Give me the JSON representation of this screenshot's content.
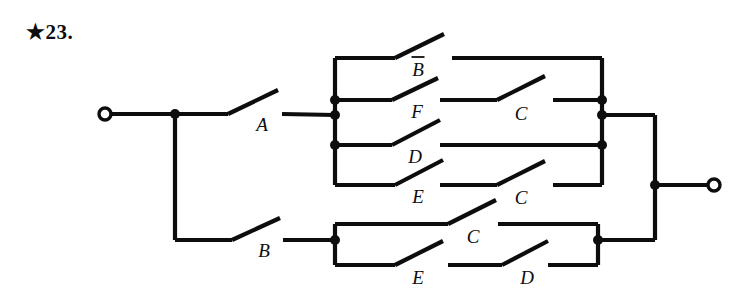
{
  "problem": {
    "marker": "★",
    "number": "23."
  },
  "figure": {
    "type": "switching-circuit-diagram",
    "width": 744,
    "height": 301,
    "stroke_color": "#0d0d0d",
    "background_color": "#ffffff",
    "terminals": [
      {
        "id": "input",
        "name": "left-terminal",
        "x": 105,
        "y": 114,
        "r": 6
      },
      {
        "id": "output",
        "name": "right-terminal",
        "x": 714,
        "y": 185,
        "r": 6
      }
    ],
    "junctions": [
      {
        "name": "input-split-node",
        "x": 175,
        "y": 114
      },
      {
        "name": "upper-left-bus-node-f",
        "x": 335,
        "y": 100
      },
      {
        "name": "upper-left-bus-node-a",
        "x": 335,
        "y": 115
      },
      {
        "name": "upper-left-bus-node-d",
        "x": 335,
        "y": 145
      },
      {
        "name": "upper-right-bus-node-f",
        "x": 602,
        "y": 100
      },
      {
        "name": "upper-right-bus-node-out",
        "x": 602,
        "y": 115
      },
      {
        "name": "upper-right-bus-node-d",
        "x": 602,
        "y": 145
      },
      {
        "name": "lower-left-bus-node-b",
        "x": 335,
        "y": 240
      },
      {
        "name": "lower-right-bus-node",
        "x": 598,
        "y": 240
      },
      {
        "name": "output-merge-node",
        "x": 655,
        "y": 185
      }
    ],
    "wires": [
      {
        "name": "input-lead",
        "points": "111,114 175,114"
      },
      {
        "name": "input-to-switch-a",
        "points": "175,114 228,114"
      },
      {
        "name": "input-down-to-b-branch",
        "points": "175,114 175,240"
      },
      {
        "name": "b-branch-to-switch-b",
        "points": "175,240 232,240"
      },
      {
        "name": "switch-a-out-to-upper-bus",
        "points": "282,114 335,115"
      },
      {
        "name": "switch-b-out-to-lower-bus",
        "points": "283,240 335,240"
      },
      {
        "name": "upper-left-bus",
        "points": "335,58 335,185"
      },
      {
        "name": "upper-rail-bbar-in",
        "points": "335,58 395,58"
      },
      {
        "name": "upper-rail-f-in",
        "points": "335,100 392,100"
      },
      {
        "name": "upper-rail-d-in",
        "points": "335,145 392,145"
      },
      {
        "name": "upper-rail-e-in",
        "points": "335,185 395,185"
      },
      {
        "name": "upper-rail-bbar-out",
        "points": "452,58 602,58"
      },
      {
        "name": "upper-rail-f-mid",
        "points": "440,100 497,100"
      },
      {
        "name": "upper-rail-f-out",
        "points": "553,100 602,100"
      },
      {
        "name": "upper-rail-d-out",
        "points": "440,145 602,145"
      },
      {
        "name": "upper-rail-e-mid",
        "points": "440,185 497,185"
      },
      {
        "name": "upper-rail-e-out",
        "points": "553,185 602,185"
      },
      {
        "name": "upper-right-bus",
        "points": "602,58 602,185"
      },
      {
        "name": "upper-block-to-output",
        "points": "602,115 655,115"
      },
      {
        "name": "lower-left-bus",
        "points": "335,224 335,265"
      },
      {
        "name": "lower-rail-c-in",
        "points": "335,224 448,224"
      },
      {
        "name": "lower-rail-e-in",
        "points": "335,265 395,265"
      },
      {
        "name": "lower-rail-c-out",
        "points": "498,224 598,224"
      },
      {
        "name": "lower-rail-d-mid",
        "points": "448,265 502,265"
      },
      {
        "name": "lower-rail-d-out",
        "points": "548,265 598,265"
      },
      {
        "name": "lower-right-bus",
        "points": "598,224 598,265"
      },
      {
        "name": "lower-block-to-output",
        "points": "598,240 655,240"
      },
      {
        "name": "output-vertical-bus",
        "points": "655,115 655,240"
      },
      {
        "name": "output-lead",
        "points": "655,185 708,185"
      }
    ],
    "switches": [
      {
        "name": "switch-a",
        "label": "A",
        "overbar": false,
        "pivot_x": 228,
        "pivot_y": 114,
        "tip_x": 278,
        "tip_y": 90,
        "label_x": 262,
        "label_y": 131
      },
      {
        "name": "switch-b",
        "label": "B",
        "overbar": false,
        "pivot_x": 232,
        "pivot_y": 240,
        "tip_x": 280,
        "tip_y": 218,
        "label_x": 264,
        "label_y": 257
      },
      {
        "name": "switch-b-bar",
        "label": "B",
        "overbar": true,
        "pivot_x": 395,
        "pivot_y": 58,
        "tip_x": 444,
        "tip_y": 34,
        "label_x": 418,
        "label_y": 76
      },
      {
        "name": "switch-f",
        "label": "F",
        "overbar": false,
        "pivot_x": 392,
        "pivot_y": 100,
        "tip_x": 438,
        "tip_y": 78,
        "label_x": 417,
        "label_y": 118
      },
      {
        "name": "switch-d-upper",
        "label": "D",
        "overbar": false,
        "pivot_x": 392,
        "pivot_y": 145,
        "tip_x": 440,
        "tip_y": 120,
        "label_x": 415,
        "label_y": 163
      },
      {
        "name": "switch-e-upper",
        "label": "E",
        "overbar": false,
        "pivot_x": 395,
        "pivot_y": 185,
        "tip_x": 443,
        "tip_y": 160,
        "label_x": 418,
        "label_y": 203
      },
      {
        "name": "switch-c-upper",
        "label": "C",
        "overbar": false,
        "pivot_x": 497,
        "pivot_y": 100,
        "tip_x": 545,
        "tip_y": 76,
        "label_x": 521,
        "label_y": 120
      },
      {
        "name": "switch-c-upper-2",
        "label": "C",
        "overbar": false,
        "pivot_x": 497,
        "pivot_y": 185,
        "tip_x": 545,
        "tip_y": 161,
        "label_x": 521,
        "label_y": 204
      },
      {
        "name": "switch-c-lower",
        "label": "C",
        "overbar": false,
        "pivot_x": 448,
        "pivot_y": 224,
        "tip_x": 496,
        "tip_y": 200,
        "label_x": 473,
        "label_y": 243
      },
      {
        "name": "switch-e-lower",
        "label": "E",
        "overbar": false,
        "pivot_x": 395,
        "pivot_y": 265,
        "tip_x": 443,
        "tip_y": 241,
        "label_x": 418,
        "label_y": 284
      },
      {
        "name": "switch-d-lower",
        "label": "D",
        "overbar": false,
        "pivot_x": 502,
        "pivot_y": 265,
        "tip_x": 548,
        "tip_y": 241,
        "label_x": 527,
        "label_y": 284
      }
    ]
  }
}
